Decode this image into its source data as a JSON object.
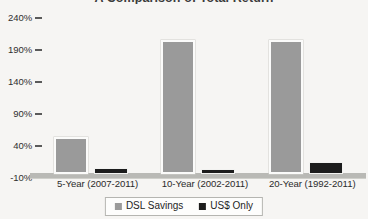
{
  "chart_data": {
    "type": "bar",
    "title": "A Comparison of Total Return",
    "xlabel": "",
    "ylabel": "",
    "categories": [
      "5-Year (2007-2011)",
      "10-Year (2002-2011)",
      "20-Year (1992-2011)"
    ],
    "series": [
      {
        "name": "DSL Savings",
        "color": "#9a9a9a",
        "values": [
          48,
          200,
          200
        ]
      },
      {
        "name": "US$ Only",
        "color": "#1c1c1c",
        "values": [
          0,
          -2,
          8
        ]
      }
    ],
    "ylim": [
      -10,
      240
    ],
    "yticks": [
      240,
      190,
      140,
      90,
      40,
      -10
    ],
    "ytick_labels": [
      "240%",
      "190%",
      "140%",
      "90%",
      "40%",
      "-10%"
    ],
    "grid": false,
    "legend_position": "bottom"
  },
  "legend": {
    "items": [
      {
        "label": "DSL Savings",
        "color": "#9a9a9a"
      },
      {
        "label": "US$ Only",
        "color": "#1c1c1c"
      }
    ]
  }
}
